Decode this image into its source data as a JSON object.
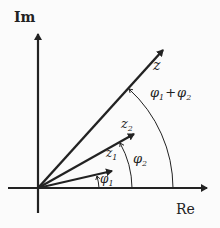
{
  "axes": {
    "imaginary_label": "Im",
    "real_label": "Re"
  },
  "vectors": [
    {
      "name": "z",
      "label": "z"
    },
    {
      "name": "z2",
      "label": "z",
      "sub": "2"
    },
    {
      "name": "z1",
      "label": "z",
      "sub": "1"
    }
  ],
  "angles": [
    {
      "name": "phi1",
      "label": "φ",
      "sub": "1"
    },
    {
      "name": "phi2",
      "label": "φ",
      "sub": "2"
    },
    {
      "name": "phi1_plus_phi2",
      "label": "φ",
      "sub": "1",
      "plus": "+",
      "label2": "φ",
      "sub2": "2"
    }
  ],
  "colors": {
    "ink": "#222222",
    "background": "#fbfbfb"
  }
}
